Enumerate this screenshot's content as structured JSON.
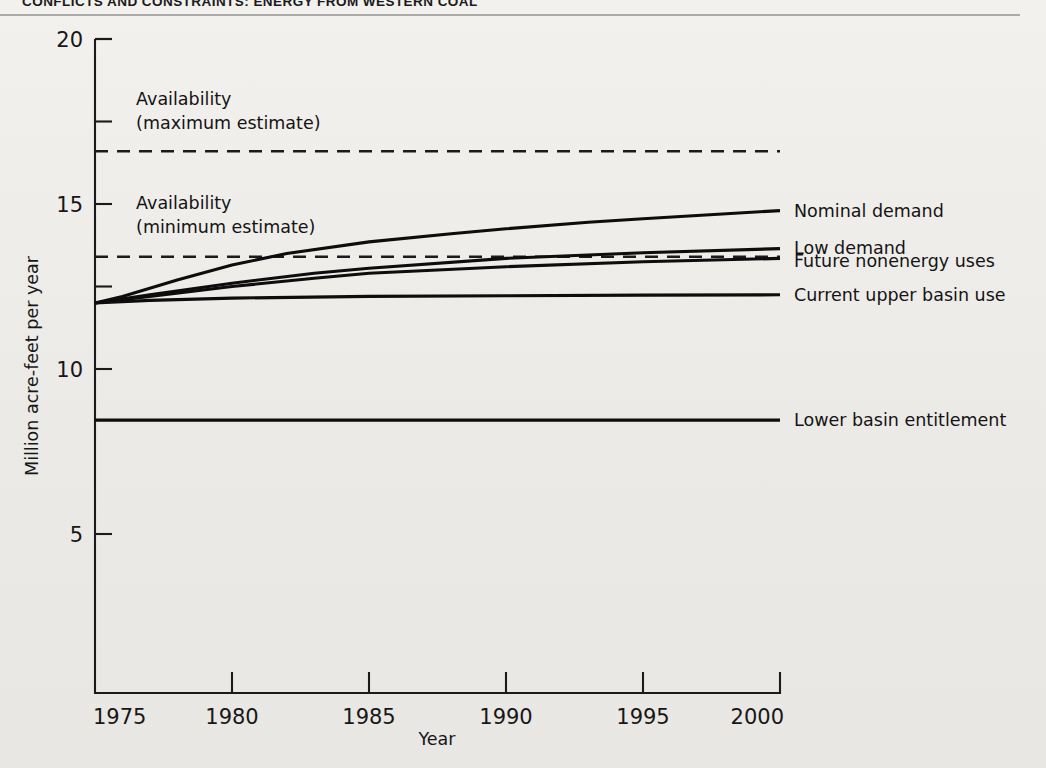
{
  "page": {
    "running_head": "CONFLICTS AND CONSTRAINTS: ENERGY FROM WESTERN COAL",
    "background_color": "#efefec",
    "ink_color": "#141414"
  },
  "chart_data": {
    "type": "line",
    "title": "",
    "xlabel": "Year",
    "ylabel": "Million acre-feet per year",
    "xlim": [
      1975,
      2000
    ],
    "ylim": [
      0.2,
      20
    ],
    "xticks": [
      1975,
      1980,
      1985,
      1990,
      1995,
      2000
    ],
    "xtick_labels": [
      "1975",
      "1980",
      "1985",
      "1990",
      "1995",
      "2000"
    ],
    "yticks": [
      5,
      10,
      15,
      20
    ],
    "ytick_labels": [
      "5",
      "10",
      "15",
      "20"
    ],
    "grid": false,
    "legend_position": "right-inline-labels",
    "series": [
      {
        "name": "Nominal demand",
        "label": "Nominal demand",
        "style": "solid",
        "x": [
          1975,
          1976,
          1977,
          1978,
          1980,
          1982,
          1985,
          1988,
          1990,
          1993,
          1995,
          2000
        ],
        "values": [
          12.0,
          12.2,
          12.45,
          12.7,
          13.15,
          13.5,
          13.85,
          14.1,
          14.25,
          14.45,
          14.55,
          14.8
        ]
      },
      {
        "name": "Low demand",
        "label": "Low demand",
        "style": "solid",
        "x": [
          1975,
          1977,
          1980,
          1983,
          1985,
          1990,
          1995,
          2000
        ],
        "values": [
          12.0,
          12.25,
          12.6,
          12.9,
          13.05,
          13.35,
          13.52,
          13.65
        ]
      },
      {
        "name": "Future nonenergy uses",
        "label": "Future nonenergy uses",
        "style": "solid",
        "x": [
          1975,
          1977,
          1980,
          1983,
          1985,
          1990,
          1995,
          2000
        ],
        "values": [
          12.0,
          12.2,
          12.5,
          12.75,
          12.9,
          13.1,
          13.25,
          13.35
        ]
      },
      {
        "name": "Current upper basin use",
        "label": "Current upper basin use",
        "style": "solid",
        "x": [
          1975,
          1977,
          1980,
          1985,
          1990,
          1995,
          2000
        ],
        "values": [
          12.0,
          12.08,
          12.15,
          12.2,
          12.22,
          12.24,
          12.25
        ]
      },
      {
        "name": "Lower basin entitlement",
        "label": "Lower basin entitlement",
        "style": "solid-flat",
        "x": [
          1975,
          2000
        ],
        "values": [
          8.45,
          8.45
        ]
      },
      {
        "name": "Availability (maximum estimate)",
        "label": "Availability\n(maximum estimate)",
        "style": "dashed",
        "x": [
          1975,
          2000
        ],
        "values": [
          16.6,
          16.6
        ]
      },
      {
        "name": "Availability (minimum estimate)",
        "label": "Availability\n(minimum estimate)",
        "style": "dashed",
        "x": [
          1975,
          2000
        ],
        "values": [
          13.4,
          13.4
        ]
      }
    ],
    "annotations": [
      {
        "name": "availability-max-annotation",
        "line1": "Availability",
        "line2": "(maximum estimate)",
        "year": 1976.5,
        "value": 18.0
      },
      {
        "name": "availability-min-annotation",
        "line1": "Availability",
        "line2": "(minimum estimate)",
        "year": 1976.5,
        "value": 14.85
      }
    ],
    "right_labels": [
      {
        "text": "Nominal demand",
        "value": 14.8
      },
      {
        "text": "Low demand",
        "value": 13.68
      },
      {
        "text": "Future nonenergy uses",
        "value": 13.28
      },
      {
        "text": "Current upper basin use",
        "value": 12.25
      },
      {
        "text": "Lower basin entitlement",
        "value": 8.45
      }
    ]
  }
}
